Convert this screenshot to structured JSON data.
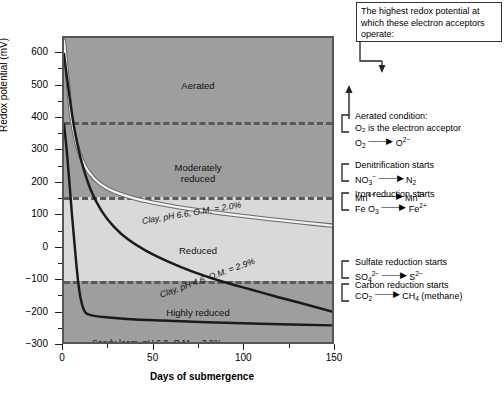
{
  "chart_data": {
    "type": "line",
    "title": "",
    "xlabel": "Days of submergence",
    "ylabel": "Redox potential (mV)",
    "xlim": [
      0,
      150
    ],
    "ylim": [
      -300,
      650
    ],
    "xticks": [
      0,
      50,
      100,
      150
    ],
    "xticks_minor": [
      25,
      75,
      125
    ],
    "yticks": [
      600,
      500,
      400,
      300,
      200,
      100,
      0,
      -100,
      -200,
      -300
    ],
    "grid": false,
    "legend": "inline-curve-labels",
    "series": [
      {
        "name": "Clay, pH 6.6, O.M. = 2.0%",
        "color": "#f2f2f2",
        "points": [
          [
            0,
            640
          ],
          [
            2,
            520
          ],
          [
            4,
            410
          ],
          [
            7,
            320
          ],
          [
            10,
            270
          ],
          [
            14,
            230
          ],
          [
            20,
            195
          ],
          [
            28,
            170
          ],
          [
            40,
            148
          ],
          [
            55,
            130
          ],
          [
            75,
            112
          ],
          [
            95,
            97
          ],
          [
            115,
            84
          ],
          [
            135,
            72
          ],
          [
            150,
            64
          ]
        ]
      },
      {
        "name": "Clay, pH 4.6, O.M. = 2.9%",
        "color": "#1a1a1a",
        "points": [
          [
            0,
            600
          ],
          [
            3,
            470
          ],
          [
            6,
            360
          ],
          [
            10,
            260
          ],
          [
            15,
            175
          ],
          [
            21,
            110
          ],
          [
            28,
            60
          ],
          [
            36,
            20
          ],
          [
            46,
            -15
          ],
          [
            58,
            -48
          ],
          [
            72,
            -80
          ],
          [
            88,
            -110
          ],
          [
            104,
            -135
          ],
          [
            120,
            -160
          ],
          [
            135,
            -182
          ],
          [
            150,
            -205
          ]
        ]
      },
      {
        "name": "Sandy loam, pH 6.0, O.M. = 3.9%",
        "color": "#1a1a1a",
        "points": [
          [
            0,
            380
          ],
          [
            1.5,
            300
          ],
          [
            3,
            200
          ],
          [
            4.5,
            95
          ],
          [
            6,
            0
          ],
          [
            7.5,
            -90
          ],
          [
            9,
            -155
          ],
          [
            10.5,
            -190
          ],
          [
            12,
            -208
          ],
          [
            15,
            -216
          ],
          [
            22,
            -222
          ],
          [
            35,
            -228
          ],
          [
            55,
            -233
          ],
          [
            80,
            -238
          ],
          [
            110,
            -243
          ],
          [
            150,
            -248
          ]
        ]
      }
    ],
    "zones": [
      {
        "label": "Aerated",
        "top_mv": 650,
        "bottom_mv": 390,
        "shade": "dark"
      },
      {
        "label": "Moderately\nreduced",
        "top_mv": 390,
        "bottom_mv": 160,
        "shade": "dark"
      },
      {
        "label": "Reduced",
        "top_mv": 160,
        "bottom_mv": -100,
        "shade": "light"
      },
      {
        "label": "Highly reduced",
        "top_mv": -100,
        "bottom_mv": -300,
        "shade": "dark"
      }
    ],
    "zone_boundaries_mv": [
      390,
      160,
      -100
    ]
  },
  "axes": {
    "y_title": "Redox potential (mV)",
    "x_title": "Days of submergence",
    "y_labels": [
      "600",
      "500",
      "400",
      "300",
      "200",
      "100",
      "0",
      "−100",
      "−200",
      "−300"
    ],
    "x_labels": [
      "0",
      "50",
      "100",
      "150"
    ]
  },
  "zone_labels": {
    "aerated": "Aerated",
    "moderately_reduced_line1": "Moderately",
    "moderately_reduced_line2": "reduced",
    "reduced": "Reduced",
    "highly_reduced": "Highly reduced"
  },
  "curve_labels": {
    "clay_66": "Clay, pH 6.6, O.M. = 2.0%",
    "clay_46": "Clay, pH 4.6, O.M. = 2.9%",
    "sandy_loam": "Sandy loam, pH 6.0, O.M. = 3.9%"
  },
  "callout": {
    "text": "The highest redox potential at which these electron acceptors operate:"
  },
  "annotations": [
    {
      "id": "aerated",
      "title": "Aerated condition:",
      "subtitle": "O₂ is the electron acceptor",
      "reactant": "O",
      "reactant_sub": "2",
      "product": "O",
      "product_sup": "2−",
      "at_mv": 400
    },
    {
      "id": "denitrification",
      "title": "Denitrification starts",
      "eq1_reactant": "NO",
      "eq1_reactant_sub": "3",
      "eq1_reactant_sup": "−",
      "eq1_product": "N",
      "eq1_product_sub": "2",
      "eq2_reactant": "Mn",
      "eq2_reactant_sup": "4+",
      "eq2_product": "Mn",
      "eq2_product_sup": "2+",
      "at_mv": 250
    },
    {
      "id": "iron-reduction",
      "title": "Iron reduction starts",
      "reactant": "Fe O",
      "reactant_sub": "3",
      "product": "Fe",
      "product_sup": "2+",
      "at_mv": 160
    },
    {
      "id": "sulfate-reduction",
      "title": "Sulfate reduction starts",
      "reactant": "SO",
      "reactant_sub": "4",
      "reactant_sup": "2−",
      "product": "S",
      "product_sup": "2−",
      "at_mv": -50
    },
    {
      "id": "carbon-reduction",
      "title": "Carbon reduction starts",
      "reactant": "CO",
      "reactant_sub": "2",
      "product": "CH",
      "product_sub": "4",
      "product_suffix": " (methane)",
      "at_mv": -120
    }
  ]
}
